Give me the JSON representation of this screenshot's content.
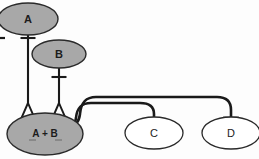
{
  "diagram": {
    "type": "regulatory-network",
    "background_color": "#fdfdfd",
    "stroke_color": "#1a1a1a",
    "filled_node_color": "#a8a8a8",
    "open_node_color": "#ffffff",
    "nodes": [
      {
        "id": "A",
        "label": "A",
        "style": "filled",
        "cx": 28,
        "cy": 19,
        "rx": 30,
        "ry": 16,
        "clipped_left": true
      },
      {
        "id": "B",
        "label": "B",
        "style": "filled",
        "cx": 59,
        "cy": 54,
        "rx": 27,
        "ry": 14
      },
      {
        "id": "AB",
        "label": "A + B",
        "sublabel_left": "",
        "sublabel_right": "",
        "style": "filled",
        "cx": 45,
        "cy": 134,
        "rx": 38,
        "ry": 21
      },
      {
        "id": "C",
        "label": "C",
        "style": "open",
        "cx": 154,
        "cy": 133,
        "rx": 29,
        "ry": 16
      },
      {
        "id": "D",
        "label": "D",
        "style": "open",
        "cx": 231,
        "cy": 133,
        "rx": 29,
        "ry": 16
      }
    ],
    "edges": [
      {
        "id": "a-to-ab",
        "from": "A",
        "to": "AB",
        "terminator": "open-arrowhead",
        "midmarker": "t-bar",
        "description": "A contributes to complex A + B"
      },
      {
        "id": "b-to-ab",
        "from": "B",
        "to": "AB",
        "terminator": "open-arrowhead",
        "midmarker": "t-bar",
        "description": "B contributes to complex A + B"
      },
      {
        "id": "ab-inhibits-c",
        "from": "AB",
        "to": "C",
        "terminator": "t-bar",
        "description": "A + B inhibits C"
      },
      {
        "id": "ab-inhibits-d",
        "from": "AB",
        "to": "D",
        "terminator": "t-bar",
        "description": "A + B inhibits D"
      }
    ],
    "left_edge_tick": {
      "id": "left-edge-mark",
      "x": 0,
      "y": 38,
      "description": "partial mark clipped at left border"
    }
  }
}
